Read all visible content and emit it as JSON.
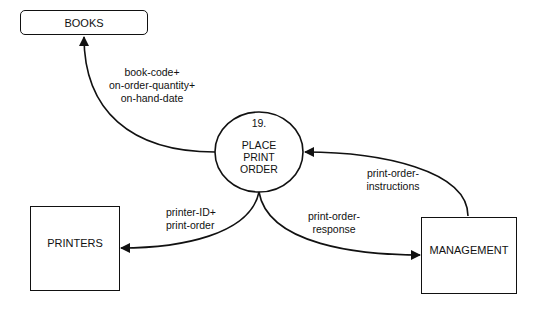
{
  "diagram": {
    "type": "data-flow-diagram",
    "process": {
      "number": "19.",
      "name_lines": [
        "PLACE",
        "PRINT",
        "ORDER"
      ]
    },
    "entities": {
      "books": "BOOKS",
      "printers": "PRINTERS",
      "management": "MANAGEMENT"
    },
    "flows": {
      "to_books": [
        "book-code+",
        "on-order-quantity+",
        "on-hand-date"
      ],
      "to_printers": [
        "printer-ID+",
        "print-order"
      ],
      "to_management": [
        "print-order-",
        "response"
      ],
      "from_management": [
        "print-order-",
        "instructions"
      ]
    }
  }
}
